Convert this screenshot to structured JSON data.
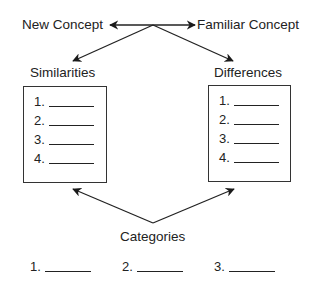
{
  "diagram": {
    "top": {
      "new_concept": "New Concept",
      "familiar_concept": "Familiar Concept"
    },
    "similarities": {
      "title": "Similarities",
      "items": [
        "1.",
        "2.",
        "3.",
        "4."
      ]
    },
    "differences": {
      "title": "Differences",
      "items": [
        "1.",
        "2.",
        "3.",
        "4."
      ]
    },
    "categories": {
      "title": "Categories",
      "items": [
        "1.",
        "2.",
        "3."
      ]
    },
    "colors": {
      "line": "#222222",
      "background": "#ffffff"
    }
  }
}
